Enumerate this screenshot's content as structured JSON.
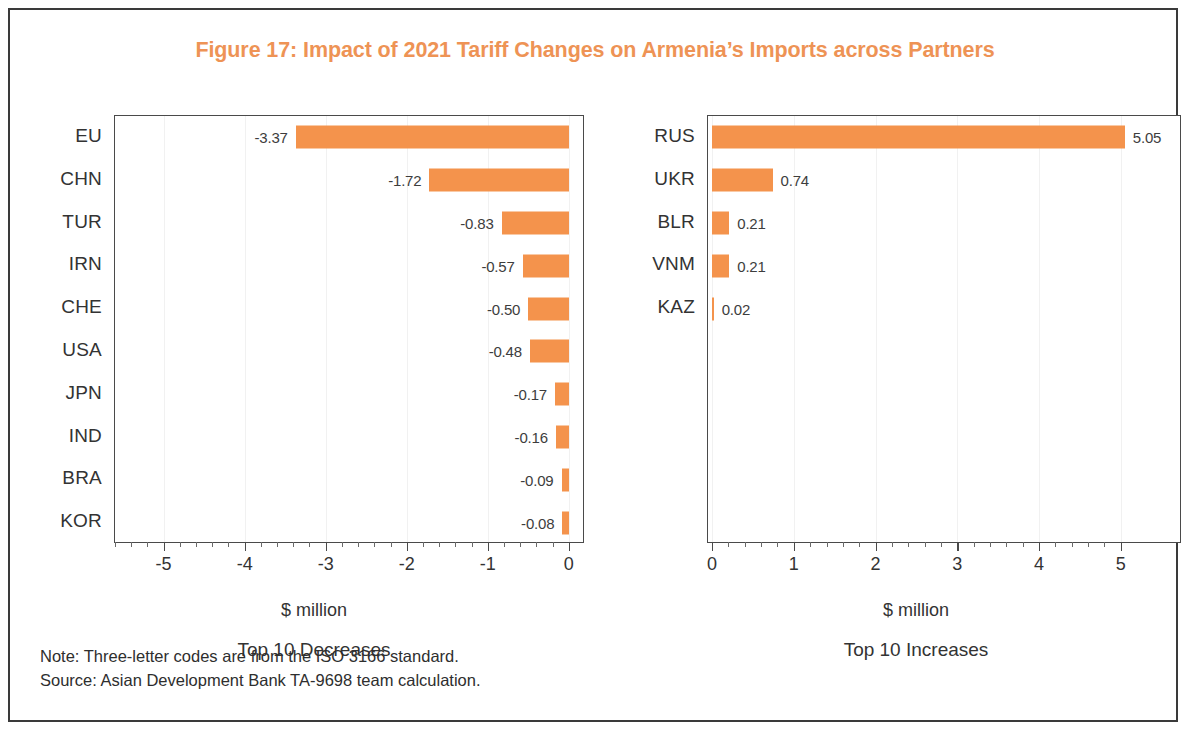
{
  "figure": {
    "title": "Figure 17: Impact of 2021 Tariff Changes on Armenia’s Imports across Partners",
    "title_color": "#EE9355",
    "bar_color": "#F4934C",
    "note": "Note: Three-letter codes are from the ISO 3166 standard.",
    "source": "Source: Asian Development Bank TA-9698 team calculation."
  },
  "chart_data": [
    {
      "type": "bar",
      "orientation": "horizontal",
      "panel": "left",
      "title": "Top 10 Decreases",
      "xlabel": "$ million",
      "ylabel": "",
      "categories": [
        "EU",
        "CHN",
        "TUR",
        "IRN",
        "CHE",
        "USA",
        "JPN",
        "IND",
        "BRA",
        "KOR"
      ],
      "values": [
        -3.37,
        -1.72,
        -0.83,
        -0.57,
        -0.5,
        -0.48,
        -0.17,
        -0.16,
        -0.09,
        -0.08
      ],
      "labels": [
        "-3.37",
        "-1.72",
        "-0.83",
        "-0.57",
        "-0.50",
        "-0.48",
        "-0.17",
        "-0.16",
        "-0.09",
        "-0.08"
      ],
      "xlim": [
        -5.6,
        0.2
      ],
      "xticks": [
        -5,
        -4,
        -3,
        -2,
        -1,
        0
      ],
      "xticklabels": [
        "-5",
        "-4",
        "-3",
        "-2",
        "-1",
        "0"
      ],
      "minor_ticks_between": 4,
      "grid": true,
      "legend": false,
      "color": "#F4934C"
    },
    {
      "type": "bar",
      "orientation": "horizontal",
      "panel": "right",
      "title": "Top 10 Increases",
      "xlabel": "$ million",
      "ylabel": "",
      "categories": [
        "RUS",
        "UKR",
        "BLR",
        "VNM",
        "KAZ"
      ],
      "values": [
        5.05,
        0.74,
        0.21,
        0.21,
        0.02
      ],
      "labels": [
        "5.05",
        "0.74",
        "0.21",
        "0.21",
        "0.02"
      ],
      "xlim": [
        -0.05,
        5.75
      ],
      "xticks": [
        0,
        1,
        2,
        3,
        4,
        5
      ],
      "xticklabels": [
        "0",
        "1",
        "2",
        "3",
        "4",
        "5"
      ],
      "minor_ticks_between": 4,
      "grid": true,
      "legend": false,
      "color": "#F4934C"
    }
  ]
}
